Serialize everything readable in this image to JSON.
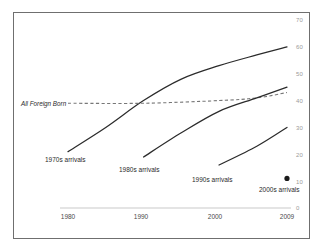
{
  "chart_data": {
    "type": "line",
    "title": "",
    "subtitle": "",
    "xlabel": "",
    "ylabel": "",
    "xlim": [
      1978,
      2010
    ],
    "ylim": [
      0,
      70
    ],
    "grid": false,
    "legend_position": "inline-annotations",
    "x_ticks": [
      "1980",
      "1990",
      "2000",
      "2009"
    ],
    "x_tick_values": [
      1980,
      1990,
      2000,
      2009
    ],
    "y_ticks": [
      "0",
      "10",
      "20",
      "30",
      "40",
      "50",
      "60",
      "70"
    ],
    "y_tick_values": [
      0,
      10,
      20,
      30,
      40,
      50,
      60,
      70
    ],
    "series": [
      {
        "name": "1970s arrivals",
        "style": "solid",
        "color": "#2b2b2b",
        "x": [
          1980,
          1985,
          1990,
          1995,
          2000,
          2005,
          2009
        ],
        "values": [
          21,
          30,
          40,
          48,
          53,
          57,
          60
        ]
      },
      {
        "name": "All Foreign Born",
        "style": "dashed",
        "color": "#777777",
        "x": [
          1980,
          1990,
          2000,
          2005,
          2009
        ],
        "values": [
          39,
          39,
          40,
          41,
          43
        ]
      },
      {
        "name": "1980s arrivals",
        "style": "solid",
        "color": "#2b2b2b",
        "x": [
          1990,
          1995,
          2000,
          2005,
          2009
        ],
        "values": [
          19,
          28,
          36,
          41,
          45
        ]
      },
      {
        "name": "1990s arrivals",
        "style": "solid",
        "color": "#2b2b2b",
        "x": [
          2000,
          2005,
          2009
        ],
        "values": [
          16,
          23,
          30
        ]
      },
      {
        "name": "2000s arrivals",
        "style": "point",
        "color": "#1a1a1a",
        "x": [
          2009
        ],
        "values": [
          11
        ]
      }
    ],
    "annotations": [
      {
        "text": "All Foreign Born",
        "x": 1979.0,
        "y": 39.5,
        "italic": true
      },
      {
        "text": "1970s arrivals",
        "x": 1980.2,
        "y": 17.0,
        "italic": false
      },
      {
        "text": "1980s arrivals",
        "x": 1990.2,
        "y": 14.0,
        "italic": false
      },
      {
        "text": "1990s arrivals",
        "x": 2000.2,
        "y": 11.0,
        "italic": false
      },
      {
        "text": "2000s arrivals",
        "x": 2006.0,
        "y": 6.5,
        "italic": false
      }
    ]
  },
  "axis": {
    "y_labels": [
      "70",
      "60",
      "50",
      "40",
      "30",
      "20",
      "10",
      "0"
    ],
    "x_labels": [
      "1980",
      "1990",
      "2000",
      "2009"
    ]
  },
  "labels": {
    "all_foreign_born": "All Foreign Born",
    "arrivals_1970s": "1970s arrivals",
    "arrivals_1980s": "1980s arrivals",
    "arrivals_1990s": "1990s arrivals",
    "arrivals_2000s": "2000s arrivals"
  },
  "colors": {
    "frame": "#6f6f6f",
    "line": "#2b2b2b",
    "dashed_line": "#777777",
    "axis_rule": "#c9c9c9",
    "ytick_text": "#9a9a9a",
    "xtick_text": "#4a4a4a",
    "background": "#ffffff"
  }
}
